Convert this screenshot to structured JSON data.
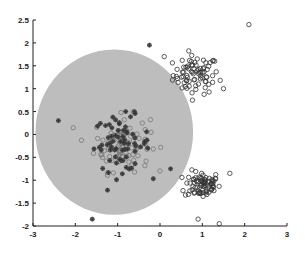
{
  "chart_data": {
    "type": "scatter",
    "title": "",
    "xlabel": "",
    "ylabel": "",
    "xlim": [
      -3,
      3
    ],
    "ylim": [
      -2,
      2.5
    ],
    "x_ticks": [
      "-3",
      "-2",
      "-1",
      "0",
      "1",
      "2",
      "3"
    ],
    "y_ticks": [
      "-2",
      "-1.5",
      "-1",
      "-0.5",
      "0",
      "0.5",
      "1",
      "1.5",
      "2",
      "2.5"
    ],
    "grid": false,
    "legend": null,
    "shapes": [
      {
        "kind": "circle",
        "center": [
          -1.08,
          0.05
        ],
        "radius": 1.9,
        "fill": "#bdbdbd"
      }
    ],
    "series": [
      {
        "name": "upper-right cluster (open circles)",
        "marker": "open-circle",
        "color": "#333333",
        "center": [
          0.85,
          1.3
        ],
        "spread": [
          0.45,
          0.35
        ],
        "count": 80,
        "outliers": [
          [
            2.1,
            2.4
          ],
          [
            0.1,
            1.7
          ],
          [
            1.5,
            1.0
          ]
        ]
      },
      {
        "name": "lower-right cluster (open circles)",
        "marker": "open-circle",
        "color": "#333333",
        "center": [
          1.0,
          -1.1
        ],
        "spread": [
          0.35,
          0.25
        ],
        "count": 80,
        "outliers": [
          [
            0.9,
            -1.85
          ],
          [
            1.4,
            -1.95
          ],
          [
            1.65,
            -0.85
          ]
        ]
      },
      {
        "name": "central cluster (open circles)",
        "marker": "open-circle",
        "color": "#777777",
        "center": [
          -0.9,
          -0.2
        ],
        "spread": [
          0.55,
          0.5
        ],
        "count": 90
      },
      {
        "name": "central cluster (filled star)",
        "marker": "filled-star",
        "color": "#444444",
        "center": [
          -0.9,
          -0.2
        ],
        "spread": [
          0.55,
          0.5
        ],
        "count": 70,
        "extras": [
          [
            -0.25,
            1.95
          ],
          [
            -1.6,
            -1.85
          ],
          [
            -2.4,
            0.3
          ],
          [
            0.25,
            -0.75
          ]
        ]
      }
    ],
    "plot_area_px": {
      "x0": 33,
      "x1": 287,
      "y0": 226,
      "y1": 20
    }
  }
}
